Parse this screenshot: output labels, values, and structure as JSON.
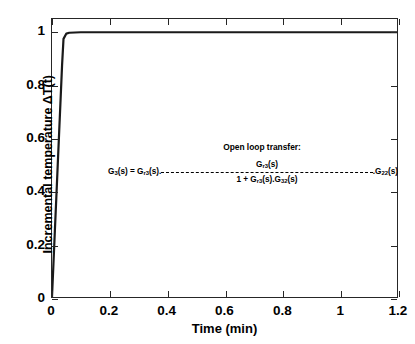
{
  "chart_data": {
    "type": "line",
    "title": "",
    "xlabel": "Time (min)",
    "ylabel": "Incremental temperature ΔT(t)",
    "xlim": [
      0,
      1.2
    ],
    "ylim": [
      0,
      1.05
    ],
    "grid": false,
    "legend": null,
    "xticks": [
      "0",
      "0.2",
      "0.4",
      "0.6",
      "0.8",
      "1",
      "1.2"
    ],
    "xtick_values": [
      0,
      0.2,
      0.4,
      0.6,
      0.8,
      1,
      1.2
    ],
    "yticks": [
      "0",
      "0.2",
      "0.4",
      "0.6",
      "0.8",
      "1"
    ],
    "ytick_values": [
      0,
      0.2,
      0.4,
      0.6,
      0.8,
      1
    ],
    "series": [
      {
        "name": "Step response ΔT(t)",
        "color": "#1a1a1a",
        "linewidth": 2.2,
        "x": [
          0,
          0.005,
          0.01,
          0.015,
          0.02,
          0.025,
          0.03,
          0.035,
          0.04,
          0.05,
          0.06,
          0.08,
          0.1,
          0.2,
          0.3,
          0.4,
          0.5,
          0.6,
          0.7,
          0.8,
          0.9,
          1.0,
          1.1,
          1.2
        ],
        "y": [
          0,
          0.125,
          0.25,
          0.375,
          0.5,
          0.625,
          0.75,
          0.875,
          0.975,
          0.995,
          0.998,
          0.999,
          1.0,
          1.0,
          1.0,
          1.0,
          1.0,
          1.0,
          1.0,
          1.0,
          1.0,
          1.0,
          1.0,
          1.0
        ]
      }
    ],
    "annotations": {
      "title": "Open loop transfer:",
      "equation_lhs": "G",
      "equation_lhs_sub": "3",
      "equation_lhs_tail": "(s) = G",
      "equation_lhs_sub2": "r3",
      "equation_lhs_tail2": "(s).",
      "numerator_base": "G",
      "numerator_sub": "r3",
      "numerator_tail": "(s)",
      "denominator_base": "1 + G",
      "denominator_sub": "r3",
      "denominator_mid": "(s).G",
      "denominator_sub2": "32",
      "denominator_tail": "(s)",
      "rhs_lead": ".G",
      "rhs_sub": "22",
      "rhs_tail": "(s)"
    }
  },
  "style": {
    "axis_color": "#262626",
    "line_color": "#1a1a1a",
    "background": "#ffffff",
    "text_color": "#000000"
  }
}
